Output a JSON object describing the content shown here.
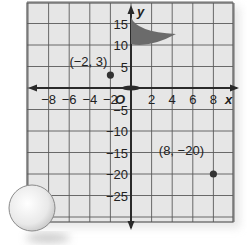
{
  "figure": {
    "type": "coordinate-plane",
    "x_axis_label": "x",
    "y_axis_label": "y",
    "origin_label": "O",
    "x_ticks": [
      {
        "value": -8,
        "label": "−8"
      },
      {
        "value": -6,
        "label": "−6"
      },
      {
        "value": -4,
        "label": "−4"
      },
      {
        "value": -2,
        "label": "−2"
      },
      {
        "value": 2,
        "label": "2"
      },
      {
        "value": 4,
        "label": "4"
      },
      {
        "value": 6,
        "label": "6"
      },
      {
        "value": 8,
        "label": "8"
      }
    ],
    "y_ticks": [
      {
        "value": 15,
        "label": "15"
      },
      {
        "value": 10,
        "label": "10"
      },
      {
        "value": 5,
        "label": "5"
      },
      {
        "value": -5,
        "label": "−5"
      },
      {
        "value": -10,
        "label": "−10"
      },
      {
        "value": -15,
        "label": "−15"
      },
      {
        "value": -20,
        "label": "−20"
      },
      {
        "value": -25,
        "label": "−25"
      }
    ],
    "x_range": [
      -10,
      10
    ],
    "y_range": [
      -30,
      20
    ],
    "x_grid_step": 2,
    "y_grid_step": 5,
    "points": [
      {
        "x": -2,
        "y": 3,
        "label": "(−2, 3)"
      },
      {
        "x": 8,
        "y": -20,
        "label": "(8, −20)"
      }
    ],
    "decorations": {
      "flag": "golf-flag at origin, pole along y-axis, pennant between y=10 and y=15",
      "ball": "golf ball at lower-left corner"
    },
    "colors": {
      "grid_bg": "#e6e6e6",
      "grid_line": "#5a5a5a",
      "axis": "#2a2a2a",
      "flag": "#6b6b6b",
      "point": "#333333",
      "ball": "#f2f2f2"
    }
  }
}
